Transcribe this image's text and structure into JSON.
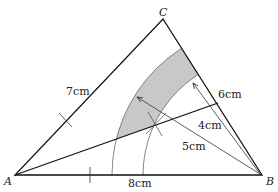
{
  "diagram": {
    "vertices": {
      "A": "A",
      "B": "B",
      "C": "C"
    },
    "sides": {
      "AC": "7cm",
      "BC": "6cm",
      "AB": "8cm"
    },
    "radii": {
      "inner": "4cm",
      "outer": "5cm"
    },
    "colors": {
      "line": "#111111",
      "shade": "#c8c8c8",
      "construction": "#444444"
    }
  }
}
